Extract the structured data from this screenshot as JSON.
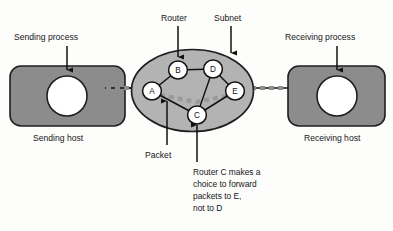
{
  "figure": {
    "background_color": "#fdfdfc"
  },
  "colors": {
    "host_fill": "#8c8c8c",
    "host_stroke": "#1f1f1f",
    "cloud_fill": "#b3b3b3",
    "cloud_stroke": "#1f1f1f",
    "node_fill": "#ffffff",
    "node_stroke": "#111111",
    "link_stroke": "#111111",
    "dash_gray": "#8d8d8d",
    "dash_inner_gray": "#9a9a9a",
    "text": "#161616"
  },
  "labels": {
    "sending_process": "Sending process",
    "sending_host": "Sending host",
    "receiving_process": "Receiving process",
    "receiving_host": "Receiving host",
    "router": "Router",
    "subnet": "Subnet",
    "packet": "Packet"
  },
  "note": {
    "lines": [
      "Router C makes a",
      "choice to forward",
      "packets to E,",
      "not to D"
    ]
  },
  "routers": [
    {
      "id": "A",
      "label": "A",
      "x": 152,
      "y": 91
    },
    {
      "id": "B",
      "label": "B",
      "x": 178,
      "y": 70
    },
    {
      "id": "C",
      "label": "C",
      "x": 197,
      "y": 115
    },
    {
      "id": "D",
      "label": "D",
      "x": 213,
      "y": 69
    },
    {
      "id": "E",
      "label": "E",
      "x": 235,
      "y": 91
    }
  ],
  "links": [
    {
      "from": "A",
      "to": "B"
    },
    {
      "from": "B",
      "to": "D"
    },
    {
      "from": "D",
      "to": "E"
    },
    {
      "from": "D",
      "to": "C"
    },
    {
      "from": "C",
      "to": "E"
    },
    {
      "from": "A",
      "to": "C"
    }
  ],
  "hosts": [
    {
      "id": "sending-host",
      "x": 10,
      "y": 66,
      "width": 115,
      "height": 60
    },
    {
      "id": "receiving-host",
      "x": 288,
      "y": 66,
      "width": 97,
      "height": 60
    }
  ]
}
